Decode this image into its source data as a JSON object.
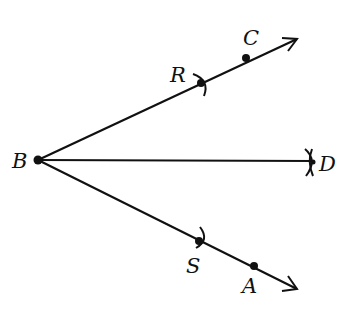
{
  "diagram": {
    "vertex": {
      "label": "B",
      "x": 38,
      "y": 160
    },
    "rays": [
      {
        "name": "ray-BC",
        "end": {
          "x": 297,
          "y": 39
        }
      },
      {
        "name": "ray-BD",
        "end": {
          "x": 314,
          "y": 161
        }
      },
      {
        "name": "ray-BA",
        "end": {
          "x": 297,
          "y": 289
        }
      }
    ],
    "points": [
      {
        "label": "B",
        "x": 38,
        "y": 160,
        "dot": true
      },
      {
        "label": "R",
        "x": 201,
        "y": 83,
        "dot": true,
        "arc": true
      },
      {
        "label": "C",
        "x": 246,
        "y": 58,
        "dot": true
      },
      {
        "label": "D",
        "x": 314,
        "y": 163,
        "dot": false,
        "arc": true
      },
      {
        "label": "S",
        "x": 199,
        "y": 241,
        "dot": true,
        "arc": true
      },
      {
        "label": "A",
        "x": 254,
        "y": 266,
        "dot": true
      }
    ],
    "labels": {
      "B": "B",
      "R": "R",
      "C": "C",
      "D": "D",
      "S": "S",
      "A": "A"
    },
    "colors": {
      "stroke": "#111111",
      "background": "#ffffff"
    }
  }
}
